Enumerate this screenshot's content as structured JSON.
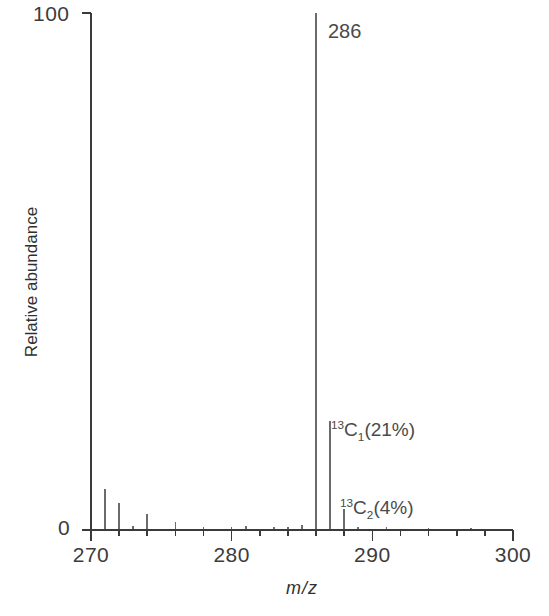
{
  "chart_data": {
    "type": "bar",
    "title": "",
    "subtitle": "",
    "xlabel": "m/z",
    "ylabel": "Relative abundance",
    "xlim": [
      270,
      300
    ],
    "ylim": [
      0,
      100
    ],
    "grid": false,
    "legend": null,
    "x_major_ticks": [
      270,
      280,
      290,
      300
    ],
    "x_major_tick_labels": [
      "270",
      "280",
      "290",
      "300"
    ],
    "x_minor_tick_step": 2,
    "y_ticks": [
      0,
      100
    ],
    "y_tick_labels": [
      "0",
      "100"
    ],
    "x": [
      270,
      271,
      272,
      273,
      274,
      276,
      278,
      280,
      281,
      283,
      284,
      285,
      286,
      287,
      288,
      289,
      291,
      294,
      297
    ],
    "values": [
      1.2,
      8.0,
      5.2,
      0.8,
      3.0,
      1.6,
      0.6,
      0.5,
      0.7,
      0.5,
      0.6,
      1.0,
      100.0,
      21.0,
      4.0,
      0.6,
      0.5,
      0.4,
      0.4
    ],
    "series": [
      {
        "name": "Relative abundance",
        "values": [
          1.2,
          8.0,
          5.2,
          0.8,
          3.0,
          1.6,
          0.6,
          0.5,
          0.7,
          0.5,
          0.6,
          1.0,
          100.0,
          21.0,
          4.0,
          0.6,
          0.5,
          0.4,
          0.4
        ]
      }
    ],
    "annotations": [
      {
        "id": "base-peak",
        "mz": 286,
        "text": "286",
        "plain": "286"
      },
      {
        "id": "c1-isotope",
        "mz": 287,
        "text": "13C1(21%)",
        "plain": "13C1(21%)",
        "percent": 21
      },
      {
        "id": "c2-isotope",
        "mz": 288,
        "text": "13C2(4%)",
        "plain": "13C2(4%)",
        "percent": 4
      }
    ],
    "line_color": "#6b6b6b",
    "axis_color": "#3a3a3a",
    "background_color": "#ffffff"
  },
  "axis": {
    "y_top_label": "100",
    "y_bottom_label": "0",
    "y_title": "Relative abundance",
    "x_title": "m/z",
    "x_labels": [
      "270",
      "280",
      "290",
      "300"
    ]
  },
  "annotations": {
    "base_peak_label": "286",
    "c1_sup": "13",
    "c1_element": "C",
    "c1_sub": "1",
    "c1_tail": "(21%)",
    "c2_sup": "13",
    "c2_element": "C",
    "c2_sub": "2",
    "c2_tail": "(4%)"
  },
  "colors": {
    "axis": "#3a3a3a",
    "peak": "#6b6b6b",
    "text": "#3c3c3c",
    "background": "#ffffff"
  }
}
